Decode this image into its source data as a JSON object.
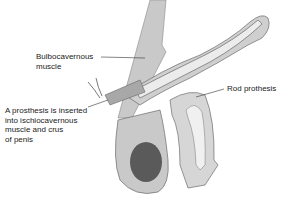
{
  "figure": {
    "labels": {
      "bulbocavernous": "Bulbocavernous\nmuscle",
      "insertion": "A prosthesis is inserted\ninto ischiocavernous\nmuscle and crus\nof penis",
      "rod": "Rod prothesis"
    },
    "colors": {
      "tissue": "#c9c9c9",
      "tissue_light": "#dedede",
      "outline": "#6b6b6b",
      "prosthesis": "#e6e6e6",
      "testis": "#5a5a5a",
      "muscle": "#8a8a8a"
    }
  }
}
